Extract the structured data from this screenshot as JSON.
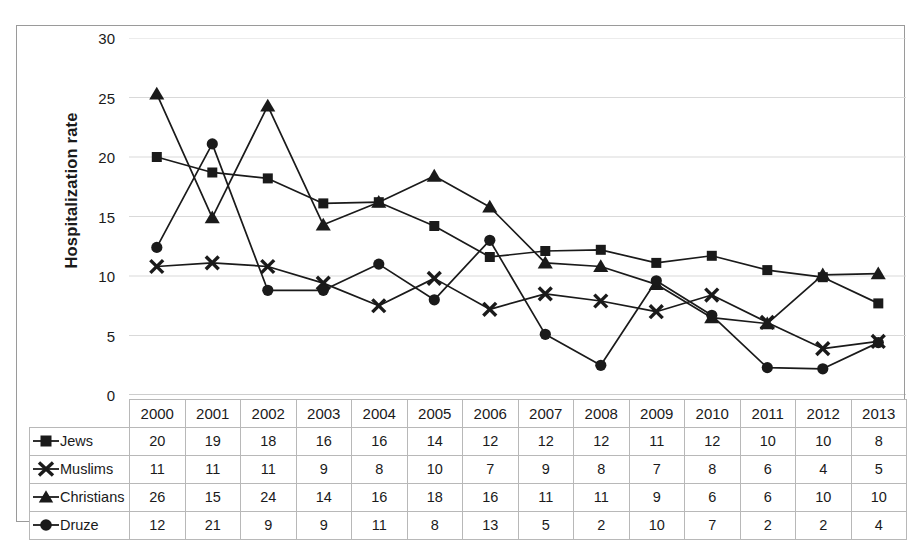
{
  "chart_data": {
    "type": "line",
    "title": "",
    "subtitle": "",
    "xlabel": "",
    "ylabel": "Hospitalization rate",
    "ylim": [
      0,
      30
    ],
    "ytick_step": 5,
    "yticks": [
      "0",
      "5",
      "10",
      "15",
      "20",
      "25",
      "30"
    ],
    "grid": true,
    "legend_position": "table-row-header",
    "categories": [
      "2000",
      "2001",
      "2002",
      "2003",
      "2004",
      "2005",
      "2006",
      "2007",
      "2008",
      "2009",
      "2010",
      "2011",
      "2012",
      "2013"
    ],
    "series": [
      {
        "name": "Jews",
        "marker": "square",
        "values": [
          20,
          19,
          18,
          16,
          16,
          14,
          12,
          12,
          12,
          11,
          12,
          10,
          10,
          8
        ],
        "plotted": [
          20.0,
          18.7,
          18.2,
          16.1,
          16.2,
          14.2,
          11.6,
          12.1,
          12.2,
          11.1,
          11.7,
          10.5,
          9.9,
          7.7
        ]
      },
      {
        "name": "Muslims",
        "marker": "x",
        "values": [
          11,
          11,
          11,
          9,
          8,
          10,
          7,
          9,
          8,
          7,
          8,
          6,
          4,
          5
        ],
        "plotted": [
          10.8,
          11.1,
          10.8,
          9.4,
          7.5,
          9.8,
          7.2,
          8.5,
          7.9,
          7.0,
          8.4,
          6.1,
          3.9,
          4.5
        ]
      },
      {
        "name": "Christians",
        "marker": "triangle",
        "values": [
          26,
          15,
          24,
          14,
          16,
          18,
          16,
          11,
          11,
          9,
          6,
          6,
          10,
          10
        ],
        "plotted": [
          25.3,
          14.9,
          24.3,
          14.3,
          16.2,
          18.4,
          15.8,
          11.1,
          10.8,
          9.3,
          6.5,
          6.0,
          10.1,
          10.2
        ]
      },
      {
        "name": "Druze",
        "marker": "circle",
        "values": [
          12,
          21,
          9,
          9,
          11,
          8,
          13,
          5,
          2,
          10,
          7,
          2,
          2,
          4
        ],
        "plotted": [
          12.4,
          21.1,
          8.8,
          8.8,
          11.0,
          8.0,
          13.0,
          5.1,
          2.5,
          9.6,
          6.7,
          2.3,
          2.2,
          4.4
        ]
      }
    ]
  },
  "table": {
    "corner_label": "",
    "year_headers": [
      "2000",
      "2001",
      "2002",
      "2003",
      "2004",
      "2005",
      "2006",
      "2007",
      "2008",
      "2009",
      "2010",
      "2011",
      "2012",
      "2013"
    ],
    "rows": [
      {
        "label": "Jews",
        "marker": "square",
        "cells": [
          "20",
          "19",
          "18",
          "16",
          "16",
          "14",
          "12",
          "12",
          "12",
          "11",
          "12",
          "10",
          "10",
          "8"
        ]
      },
      {
        "label": "Muslims",
        "marker": "x",
        "cells": [
          "11",
          "11",
          "11",
          "9",
          "8",
          "10",
          "7",
          "9",
          "8",
          "7",
          "8",
          "6",
          "4",
          "5"
        ]
      },
      {
        "label": "Christians",
        "marker": "triangle",
        "cells": [
          "26",
          "15",
          "24",
          "14",
          "16",
          "18",
          "16",
          "11",
          "11",
          "9",
          "6",
          "6",
          "10",
          "10"
        ]
      },
      {
        "label": "Druze",
        "marker": "circle",
        "cells": [
          "12",
          "21",
          "9",
          "9",
          "11",
          "8",
          "13",
          "5",
          "2",
          "10",
          "7",
          "2",
          "2",
          "4"
        ]
      }
    ]
  },
  "axis": {
    "y_title": "Hospitalization rate",
    "y_tick_labels": [
      "30",
      "25",
      "20",
      "15",
      "10",
      "5",
      "0"
    ]
  },
  "colors": {
    "ink": "#1a1a1a",
    "gridline": "#d9d9d9",
    "frame": "#9a9a9a",
    "table_border": "#b8b8b8",
    "background": "#ffffff"
  }
}
